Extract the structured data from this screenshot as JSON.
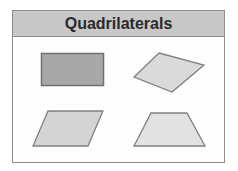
{
  "title": "Quadrilaterals",
  "shapes": [
    {
      "name": "rectangle",
      "fill": "#a8a8a8",
      "stroke": "#707070"
    },
    {
      "name": "rhombus",
      "fill": "#dadada",
      "stroke": "#808080"
    },
    {
      "name": "parallelogram",
      "fill": "#d4d4d4",
      "stroke": "#808080"
    },
    {
      "name": "trapezoid",
      "fill": "#e2e2e2",
      "stroke": "#808080"
    }
  ]
}
